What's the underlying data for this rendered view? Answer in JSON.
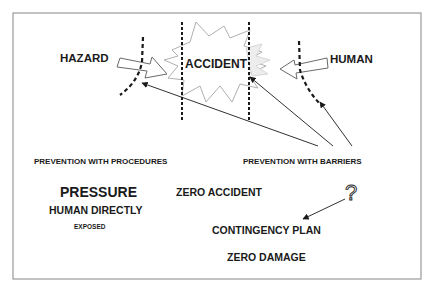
{
  "diagram": {
    "labels": {
      "hazard": "HAZARD",
      "human": "HUMAN",
      "accident": "ACCIDENT",
      "prevention_procedures": "PREVENTION WITH PROCEDURES",
      "prevention_barriers": "PREVENTION WITH BARRIERS",
      "pressure": "PRESSURE",
      "human_directly": "HUMAN DIRECTLY",
      "exposed": "EXPOSED",
      "zero_accident": "ZERO ACCIDENT",
      "question": "?",
      "contingency_plan": "CONTINGENCY PLAN",
      "zero_damage": "ZERO DAMAGE"
    },
    "colors": {
      "background": "#ffffff",
      "frame": "#9a9a9a",
      "ink": "#1a1a1a",
      "starburst": "#b0b0b0",
      "hollow_arrow": "#6a6a6a"
    }
  }
}
